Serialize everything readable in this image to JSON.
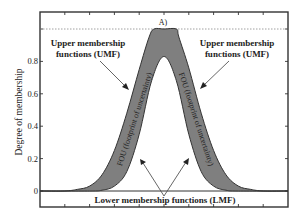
{
  "chart_data": {
    "type": "area",
    "title": "A)",
    "xlabel": "",
    "ylabel": "Degree of membership",
    "xlim": [
      0,
      10
    ],
    "ylim": [
      -0.1,
      1.1
    ],
    "yticks": [
      0,
      0.2,
      0.4,
      0.6,
      0.8,
      1
    ],
    "ytick_labels": [
      "0",
      "0.2",
      "0.4",
      "0.6",
      "0.8",
      ""
    ],
    "xticks": [
      1,
      2,
      3,
      4,
      5,
      6,
      7,
      8,
      9
    ],
    "xtick_labels": [],
    "grid": false,
    "reference_lines": [
      {
        "y": 1,
        "style": "dotted"
      },
      {
        "y": 0,
        "style": "solid"
      }
    ],
    "series": [
      {
        "name": "Upper membership functions (UMF)",
        "x": [
          0,
          1,
          1.5,
          2,
          2.5,
          3,
          3.5,
          4,
          4.4,
          4.6,
          5,
          5.5,
          5.6,
          6,
          6.5,
          7,
          7.5,
          8,
          8.5,
          9,
          10
        ],
        "values": [
          0,
          0,
          0.01,
          0.03,
          0.1,
          0.25,
          0.48,
          0.75,
          0.95,
          1.0,
          1.0,
          1.0,
          0.95,
          0.76,
          0.48,
          0.25,
          0.1,
          0.03,
          0.01,
          0,
          0
        ]
      },
      {
        "name": "Lower membership functions (LMF)",
        "x": [
          0,
          2,
          2.5,
          3,
          3.5,
          4,
          4.5,
          5,
          5.5,
          6,
          6.5,
          7,
          7.5,
          8,
          10
        ],
        "values": [
          0,
          0,
          0.005,
          0.03,
          0.12,
          0.35,
          0.68,
          0.83,
          0.68,
          0.35,
          0.12,
          0.03,
          0.005,
          0,
          0
        ]
      }
    ],
    "fill_between": {
      "name": "FOU (footprint of uncertainty)",
      "color": "#7f7f7f"
    },
    "annotations": [
      {
        "text_lines": [
          "Upper membership",
          "functions (UMF)"
        ],
        "side": "left"
      },
      {
        "text_lines": [
          "Upper membership",
          "functions (UMF)"
        ],
        "side": "right"
      },
      {
        "text": "FOU (footprint of uncertainty)",
        "side": "left",
        "rotated": true
      },
      {
        "text": "FOU (footprint of uncertainty)",
        "side": "right",
        "rotated": true
      },
      {
        "text": "Lower membership functions (LMF)",
        "side": "bottom"
      }
    ],
    "colors": {
      "fou_fill": "#7f7f7f",
      "curve": "#333333",
      "frame": "#333333"
    }
  }
}
